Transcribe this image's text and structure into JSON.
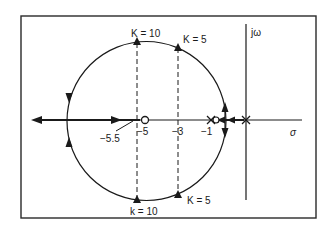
{
  "diagram": {
    "type": "root-locus",
    "axes": {
      "real_label": "σ",
      "imag_label": "jω"
    },
    "poles": [
      0,
      -1
    ],
    "zeros": [
      -5,
      -0.7
    ],
    "breakaway_label": "−5.5",
    "tick_labels": {
      "neg5": "−5",
      "neg3": "−3",
      "neg1": "−1"
    },
    "gain_labels": {
      "top_k10": "K = 10",
      "top_k5": "K = 5",
      "bottom_k10": "k = 10",
      "bottom_k5": "K = 5"
    },
    "colors": {
      "line": "#1a1a1a",
      "frame": "#2a2a2a",
      "background": "#ffffff"
    }
  }
}
